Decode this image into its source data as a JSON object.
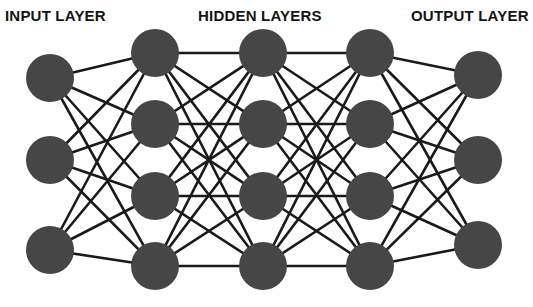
{
  "diagram": {
    "type": "neural-network-architecture",
    "background_color": "#ffffff",
    "node_color": "#464646",
    "edge_color": "#1a1a1a",
    "label_color": "#141414",
    "node_radius": 24,
    "edge_width": 2.6,
    "labels": {
      "input": "INPUT LAYER",
      "hidden": "HIDDEN LAYERS",
      "output": "OUTPUT LAYER"
    },
    "layers": [
      {
        "name": "input-layer",
        "role": "input",
        "node_count": 3,
        "x": 50,
        "nodes_y": [
          78,
          160,
          250
        ]
      },
      {
        "name": "hidden-layer-1",
        "role": "hidden",
        "node_count": 4,
        "x": 155,
        "nodes_y": [
          53,
          124,
          196,
          266
        ]
      },
      {
        "name": "hidden-layer-2",
        "role": "hidden",
        "node_count": 4,
        "x": 263,
        "nodes_y": [
          53,
          124,
          196,
          266
        ]
      },
      {
        "name": "hidden-layer-3",
        "role": "hidden",
        "node_count": 4,
        "x": 370,
        "nodes_y": [
          53,
          124,
          196,
          266
        ]
      },
      {
        "name": "output-layer",
        "role": "output",
        "node_count": 3,
        "x": 478,
        "nodes_y": [
          75,
          160,
          245
        ]
      }
    ],
    "connections": "fully-connected-between-adjacent-layers"
  }
}
